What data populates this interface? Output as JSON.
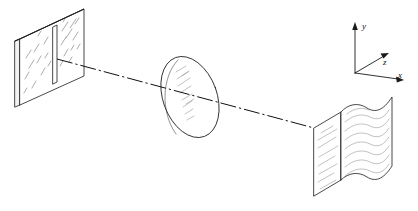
{
  "figure": {
    "background_color": "#ffffff",
    "line_color": "#1a1a1a",
    "hatch_color": "#5a5a5a",
    "width": 418,
    "height": 211
  },
  "axes": {
    "name": "coordinate-axes",
    "origin": {
      "x": 355,
      "y": 73
    },
    "labels": {
      "y": "y",
      "z": "z",
      "x": "x"
    },
    "y_axis": {
      "x1": 355,
      "y1": 73,
      "x2": 355,
      "y2": 24,
      "label_x": 362,
      "label_y": 28
    },
    "z_axis": {
      "x1": 355,
      "y1": 73,
      "x2": 388,
      "y2": 54,
      "label_x": 385,
      "label_y": 63
    },
    "x_axis": {
      "x1": 355,
      "y1": 73,
      "x2": 403,
      "y2": 80,
      "label_x": 399,
      "label_y": 80
    }
  },
  "optical_axis": {
    "name": "optical-axis-chain-line",
    "style": "dash-dot",
    "start": {
      "x": 57,
      "y": 59
    },
    "end": {
      "x": 314,
      "y": 128
    }
  },
  "components": [
    {
      "id": "slit-plate",
      "label": "Slit plate with single vertical slit",
      "type": "plate",
      "position": "left"
    },
    {
      "id": "lens",
      "label": "Converging lens",
      "type": "ellipse",
      "position": "center"
    },
    {
      "id": "screen",
      "label": "Curved observation screen with diffraction fringes",
      "type": "folded-sheet",
      "position": "right"
    }
  ]
}
